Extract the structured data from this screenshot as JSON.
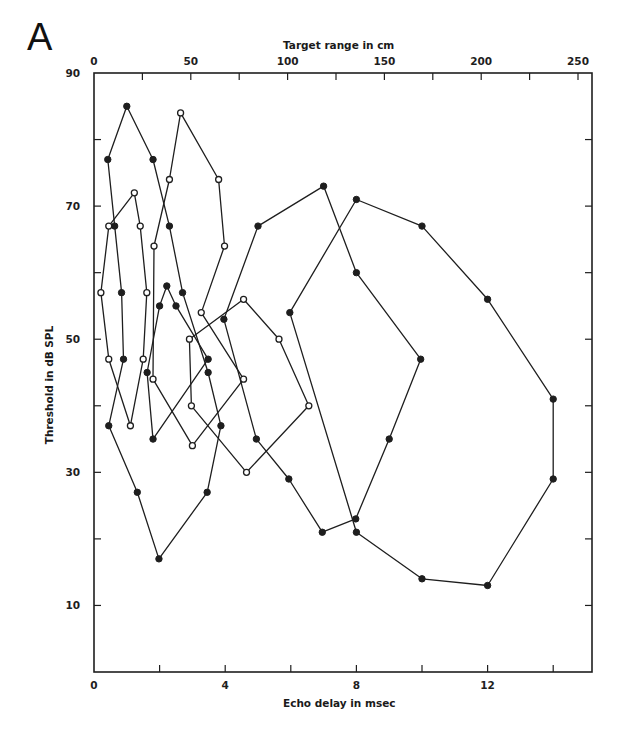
{
  "panel_label": "A",
  "chart_data": {
    "type": "line",
    "title": "",
    "xlabel": "Echo delay in msec",
    "x2label": "Target range in cm",
    "ylabel": "Threshold in dB SPL",
    "xlim": [
      0,
      15
    ],
    "ylim": [
      0,
      90
    ],
    "x2lim": [
      0,
      258
    ],
    "grid": false,
    "legend": null,
    "x_ticks": [
      0,
      2,
      4,
      6,
      8,
      10,
      12,
      14
    ],
    "x_tick_labels": {
      "0": "0",
      "4": "4",
      "8": "8",
      "12": "12"
    },
    "x2_ticks": [
      0,
      25,
      50,
      75,
      100,
      125,
      150,
      175,
      200,
      225,
      250
    ],
    "x2_tick_labels": {
      "0": "0",
      "50": "50",
      "100": "100",
      "150": "150",
      "200": "200",
      "250": "250"
    },
    "y_ticks": [
      0,
      10,
      20,
      30,
      40,
      50,
      60,
      70,
      80,
      90
    ],
    "y_tick_labels": {
      "10": "10",
      "30": "30",
      "50": "50",
      "70": "70",
      "90": "90"
    },
    "series": [
      {
        "name": "loop-1",
        "marker": "filled",
        "closed": true,
        "points": [
          [
            0.42,
            77
          ],
          [
            1.0,
            85
          ],
          [
            1.8,
            77
          ],
          [
            2.3,
            67
          ],
          [
            2.7,
            57
          ],
          [
            3.48,
            45
          ],
          [
            3.87,
            37
          ],
          [
            3.45,
            27
          ],
          [
            1.98,
            17
          ],
          [
            1.32,
            27
          ],
          [
            0.45,
            37
          ],
          [
            0.9,
            47
          ],
          [
            0.84,
            57
          ],
          [
            0.63,
            67
          ]
        ]
      },
      {
        "name": "loop-2",
        "marker": "open",
        "closed": true,
        "points": [
          [
            0.45,
            67
          ],
          [
            1.23,
            72
          ],
          [
            1.41,
            67
          ],
          [
            1.61,
            57
          ],
          [
            1.5,
            47
          ],
          [
            1.11,
            37
          ],
          [
            0.45,
            47
          ],
          [
            0.21,
            57
          ]
        ]
      },
      {
        "name": "loop-3",
        "marker": "filled",
        "closed": true,
        "points": [
          [
            2.22,
            58
          ],
          [
            2.5,
            55
          ],
          [
            3.48,
            47
          ],
          [
            1.8,
            35
          ],
          [
            1.62,
            45
          ],
          [
            2.0,
            55
          ]
        ]
      },
      {
        "name": "loop-4",
        "marker": "open",
        "closed": true,
        "points": [
          [
            2.64,
            84
          ],
          [
            3.8,
            74
          ],
          [
            3.98,
            64
          ],
          [
            3.27,
            54
          ],
          [
            4.56,
            44
          ],
          [
            3.0,
            34
          ],
          [
            1.8,
            44
          ],
          [
            1.83,
            64
          ],
          [
            2.3,
            74
          ]
        ]
      },
      {
        "name": "loop-5",
        "marker": "open",
        "closed": true,
        "points": [
          [
            2.91,
            50
          ],
          [
            4.56,
            56
          ],
          [
            5.64,
            50
          ],
          [
            6.55,
            40
          ],
          [
            4.65,
            30
          ],
          [
            2.97,
            40
          ]
        ]
      },
      {
        "name": "loop-6",
        "marker": "filled",
        "closed": true,
        "points": [
          [
            5.0,
            67
          ],
          [
            7.0,
            73
          ],
          [
            8.0,
            60
          ],
          [
            9.96,
            47
          ],
          [
            9.0,
            35
          ],
          [
            7.98,
            23
          ],
          [
            6.96,
            21
          ],
          [
            5.94,
            29
          ],
          [
            4.95,
            35
          ],
          [
            3.96,
            53
          ]
        ]
      },
      {
        "name": "loop-7",
        "marker": "filled",
        "closed": true,
        "points": [
          [
            5.97,
            54
          ],
          [
            8.0,
            71
          ],
          [
            10.0,
            67
          ],
          [
            12.0,
            56
          ],
          [
            14.0,
            41
          ],
          [
            14.0,
            29
          ],
          [
            12.0,
            13
          ],
          [
            10.0,
            14
          ],
          [
            8.0,
            21
          ]
        ]
      }
    ]
  },
  "colors": {
    "ink": "#1e1e1e",
    "background": "#ffffff"
  }
}
